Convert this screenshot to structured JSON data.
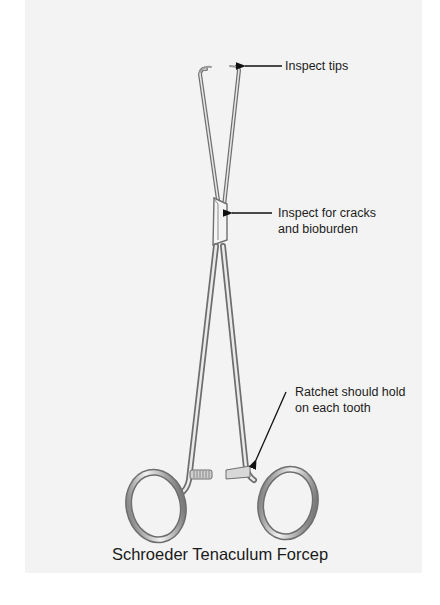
{
  "figure": {
    "title": "Schroeder Tenaculum Forcep",
    "background_color": "#f3f3f3",
    "callouts": [
      {
        "id": "tips",
        "lines": [
          "Inspect tips"
        ]
      },
      {
        "id": "box-joint",
        "lines": [
          "Inspect for cracks",
          "and bioburden"
        ]
      },
      {
        "id": "ratchet",
        "lines": [
          "Ratchet should hold",
          "on each tooth"
        ]
      }
    ],
    "instrument": {
      "name": "Schroeder Tenaculum Forcep",
      "parts": [
        "tips",
        "jaws",
        "box-joint",
        "shanks",
        "ratchet",
        "finger-rings"
      ],
      "metal_color": "#c9c9c9",
      "edge_color": "#6e6e6e"
    }
  }
}
